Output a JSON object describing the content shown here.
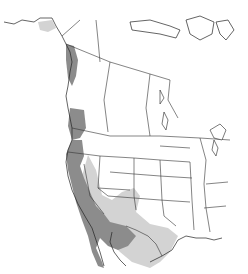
{
  "map": {
    "type": "range-map",
    "region": "North America",
    "legend_colors": {
      "year_round": "#8c8c8c",
      "seasonal": "#d3d3d3",
      "background": "#ffffff",
      "borders": "#333333"
    },
    "ranges": [
      {
        "name": "year-round",
        "areas": [
          "Pacific Coast (British Columbia to Baja California)",
          "California",
          "Baja California",
          "Sonora",
          "Arizona (south)"
        ]
      },
      {
        "name": "seasonal",
        "areas": [
          "Southern Alaska coast",
          "Nevada",
          "Utah (south)",
          "New Mexico",
          "Texas",
          "Northern Mexico"
        ]
      }
    ]
  }
}
